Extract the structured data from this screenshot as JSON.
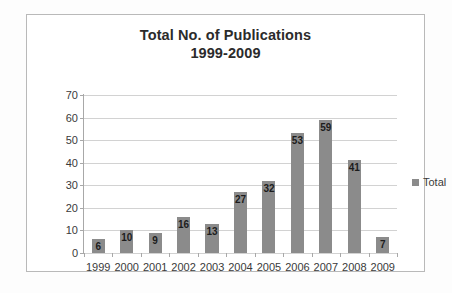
{
  "chart_data": {
    "type": "bar",
    "title": "Total No. of Publications",
    "subtitle": "1999-2009",
    "categories": [
      "1999",
      "2000",
      "2001",
      "2002",
      "2003",
      "2004",
      "2005",
      "2006",
      "2007",
      "2008",
      "2009"
    ],
    "values": [
      6,
      10,
      9,
      16,
      13,
      27,
      32,
      53,
      59,
      41,
      7
    ],
    "series": [
      {
        "name": "Total",
        "values": [
          6,
          10,
          9,
          16,
          13,
          27,
          32,
          53,
          59,
          41,
          7
        ]
      }
    ],
    "xlabel": "",
    "ylabel": "",
    "ylim": [
      0,
      70
    ],
    "yticks": [
      0,
      10,
      20,
      30,
      40,
      50,
      60,
      70
    ],
    "ytick_labels": [
      "0",
      "10",
      "20",
      "30",
      "40",
      "50",
      "60",
      "70"
    ],
    "grid": true,
    "legend": {
      "position": "right",
      "entries": [
        "Total"
      ]
    },
    "colors": {
      "bar": "#8b8b8b",
      "gridline": "#d2d2d2",
      "axis": "#a8a8a8",
      "text": "#3a3a3a",
      "title": "#2b2b2b",
      "background": "#ffffff",
      "frame": "#b9b9b9"
    },
    "data_labels": [
      "6",
      "10",
      "9",
      "16",
      "13",
      "27",
      "32",
      "53",
      "59",
      "41",
      "7"
    ]
  }
}
